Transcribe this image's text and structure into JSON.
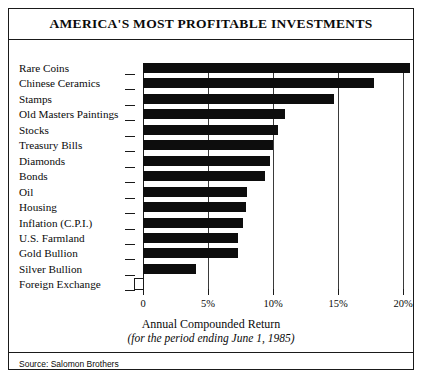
{
  "title": "AMERICA'S MOST PROFITABLE INVESTMENTS",
  "axis_caption": "Annual Compounded Return",
  "axis_subcaption": "(for the period ending June 1, 1985)",
  "source": "Source: Salomon Brothers",
  "chart_data": {
    "type": "bar",
    "orientation": "horizontal",
    "title": "AMERICA'S MOST PROFITABLE INVESTMENTS",
    "subtitle": "",
    "xlabel": "Annual Compounded Return",
    "xlabel_note": "(for the period ending June 1, 1985)",
    "ylabel": "",
    "xlim": [
      0,
      21.5
    ],
    "xticks": [
      0,
      5,
      10,
      15,
      20
    ],
    "xtick_labels": [
      "0",
      "5%",
      "10%",
      "15%",
      "20%"
    ],
    "grid": true,
    "grid_axis": "x",
    "legend": false,
    "bar_color": "#0d0d0d",
    "categories": [
      "Rare Coins",
      "Chinese Ceramics",
      "Stamps",
      "Old Masters Paintings",
      "Stocks",
      "Treasury Bills",
      "Diamonds",
      "Bonds",
      "Oil",
      "Housing",
      "Inflation (C.P.I.)",
      "U.S. Farmland",
      "Gold Bullion",
      "Silver Bullion",
      "Foreign Exchange"
    ],
    "values": [
      20.5,
      17.8,
      14.7,
      10.9,
      10.4,
      10.0,
      9.8,
      9.4,
      8.0,
      7.9,
      7.7,
      7.3,
      7.3,
      4.1,
      0.3
    ],
    "source": "Source: Salomon Brothers"
  }
}
